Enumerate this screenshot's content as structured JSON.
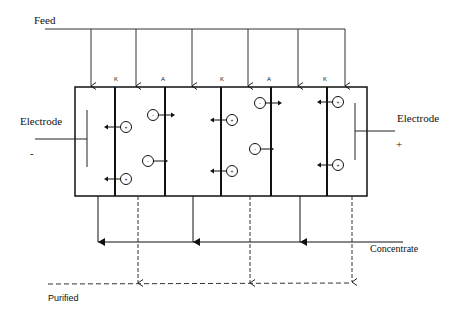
{
  "diagram": {
    "type": "electrodialysis-stack",
    "labels": {
      "feed": "Feed",
      "electrode_left": "Electrode",
      "electrode_left_sign": "-",
      "electrode_right": "Electrode",
      "electrode_right_sign": "+",
      "concentrate": "Concentrate",
      "purified": "Purified"
    },
    "membranes": [
      {
        "label": "K",
        "type": "cation-exchange"
      },
      {
        "label": "A",
        "type": "anion-exchange"
      },
      {
        "label": "K",
        "type": "cation-exchange"
      },
      {
        "label": "A",
        "type": "anion-exchange"
      },
      {
        "label": "K",
        "type": "cation-exchange"
      }
    ],
    "ions": {
      "cation_symbol": "+",
      "anion_symbol": "-"
    },
    "compartments": [
      {
        "index": 0,
        "stream": "electrode"
      },
      {
        "index": 1,
        "stream": "purified"
      },
      {
        "index": 2,
        "stream": "concentrate"
      },
      {
        "index": 3,
        "stream": "purified"
      },
      {
        "index": 4,
        "stream": "concentrate"
      },
      {
        "index": 5,
        "stream": "electrode"
      }
    ],
    "colors": {
      "line": "#111111",
      "background": "#ffffff"
    }
  }
}
